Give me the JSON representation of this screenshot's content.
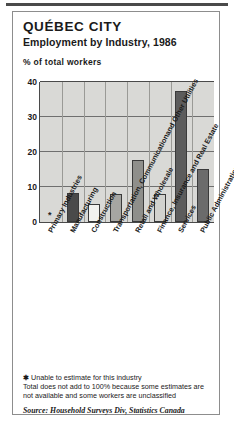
{
  "chart_data": {
    "type": "bar",
    "title": "QUÉBEC CITY",
    "subtitle": "Employment by Industry, 1986",
    "ylabel": "% of total workers",
    "xlabel": "",
    "ylim": [
      0,
      40
    ],
    "yticks": [
      0,
      10,
      20,
      30,
      40
    ],
    "ytick_labels": [
      "0",
      "10",
      "20",
      "30",
      "40"
    ],
    "grid": true,
    "legend": "none",
    "categories": [
      "Primary Industries",
      "Manufacturing",
      "Construction",
      "Transportation, Communication and Other Utilities",
      "Retail and Wholesale",
      "Finance, Insurance and Real Estate",
      "Services",
      "Public Administration"
    ],
    "category_lines": [
      [
        "Primary Industries"
      ],
      [
        "Manufacturing"
      ],
      [
        "Construction"
      ],
      [
        "Transportation, Communication",
        "and Other Utilities"
      ],
      [
        "Retail and Wholesale"
      ],
      [
        "Finance, Insurance and Real Estate"
      ],
      [
        "Services"
      ],
      [
        "Public Administration"
      ]
    ],
    "values": [
      null,
      8.2,
      5.1,
      8.1,
      17.7,
      8.1,
      37.5,
      15.1
    ],
    "value_notes": [
      "*",
      "",
      "",
      "",
      "",
      "",
      "",
      ""
    ],
    "bar_colors": [
      "none",
      "#4a4a4a",
      "#f2f2ef",
      "#a6a6a2",
      "#8f8f8b",
      "#d2d2ce",
      "#5c5c5c",
      "#6b6b6b"
    ],
    "plot_background": "#d9d9d6",
    "axis_color": "#4a4a4a"
  },
  "notes": {
    "asterisk_symbol": "✱",
    "footnote_asterisk": "Unable to estimate for this industry",
    "footnote_line1": "Total does not add to 100% because some estimates are",
    "footnote_line2": "not available and some workers are unclassified",
    "source": "Source: Household Surveys Div, Statistics Canada"
  }
}
